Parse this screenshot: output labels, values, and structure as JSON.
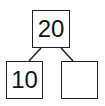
{
  "diagram": {
    "type": "number-bond",
    "whole": "20",
    "parts": [
      "10",
      ""
    ]
  }
}
